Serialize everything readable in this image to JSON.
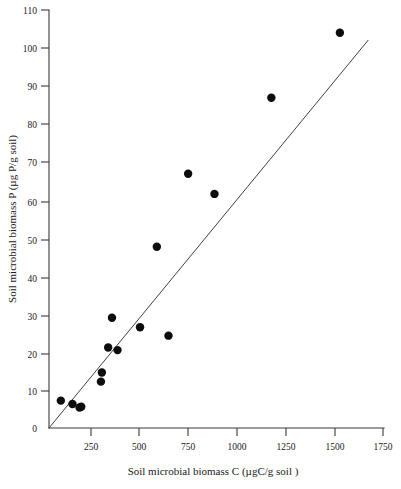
{
  "chart_data": {
    "type": "scatter",
    "title": "",
    "xlabel": "Soil microbial biomass C (µgC/g soil )",
    "ylabel": "Soil microbial biomass P (µg P/g soil)",
    "xlim": [
      0,
      1750
    ],
    "ylim": [
      0,
      110
    ],
    "xticks": [
      0,
      250,
      500,
      750,
      1000,
      1250,
      1500,
      1750
    ],
    "xticklabels": [
      "0",
      "250",
      "500",
      "750",
      "1000",
      "1250",
      "1500",
      "1750"
    ],
    "yticks": [
      0,
      10,
      20,
      30,
      40,
      50,
      60,
      70,
      80,
      90,
      100,
      110
    ],
    "yticklabels": [
      "0",
      "10",
      "20",
      "30",
      "40",
      "50",
      "60",
      "70",
      "80",
      "90",
      "100",
      "110"
    ],
    "grid": false,
    "legend": false,
    "marker_color": "#0d0d0d",
    "marker_size": 4.2,
    "line_color": "#404040",
    "axis_color": "#3a3a3a",
    "series": [
      {
        "name": "Soil samples",
        "marker": "filled-circle",
        "points": [
          {
            "x": 62,
            "y": 7.2
          },
          {
            "x": 123,
            "y": 6.3
          },
          {
            "x": 160,
            "y": 5.4
          },
          {
            "x": 272,
            "y": 12.2
          },
          {
            "x": 277,
            "y": 14.6
          },
          {
            "x": 310,
            "y": 21.2
          },
          {
            "x": 330,
            "y": 29.0
          },
          {
            "x": 359,
            "y": 20.5
          },
          {
            "x": 477,
            "y": 26.5
          },
          {
            "x": 626,
            "y": 24.3
          },
          {
            "x": 565,
            "y": 47.7
          },
          {
            "x": 729,
            "y": 66.9
          },
          {
            "x": 867,
            "y": 61.6
          },
          {
            "x": 1165,
            "y": 86.9
          },
          {
            "x": 1524,
            "y": 104.0
          },
          {
            "x": 169,
            "y": 5.6
          }
        ]
      }
    ],
    "fit_line": {
      "name": "regression-line",
      "x_start": 0,
      "y_start": 0,
      "x_end": 1673,
      "y_end": 102.1
    }
  },
  "axis_labels": {
    "x_title": "Soil microbial biomass C (µgC/g soil )",
    "y_title": "Soil microbial biomass P (µg P/g soil)"
  },
  "x_tick_text": {
    "t0": "0",
    "t1": "250",
    "t2": "500",
    "t3": "750",
    "t4": "1000",
    "t5": "1250",
    "t6": "1500",
    "t7": "1750"
  },
  "y_tick_text": {
    "t0": "0",
    "t1": "10",
    "t2": "20",
    "t3": "30",
    "t4": "40",
    "t5": "50",
    "t6": "60",
    "t7": "70",
    "t8": "80",
    "t9": "90",
    "t10": "100",
    "t11": "110"
  }
}
